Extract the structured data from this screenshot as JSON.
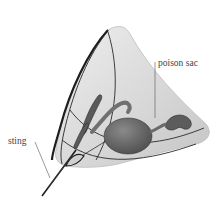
{
  "figure": {
    "labels": {
      "poison_sac": "poison sac",
      "sting": "sting"
    },
    "colors": {
      "background": "#ffffff",
      "body_fill": "#dcdcdc",
      "sac_fill": "#6e6e6e",
      "outline": "#2a2a2a",
      "text": "#444444"
    }
  }
}
